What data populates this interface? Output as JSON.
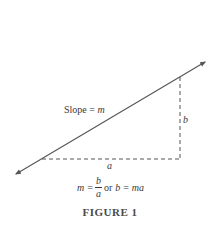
{
  "figure": {
    "caption": "FIGURE 1",
    "slope_label_prefix": "Slope = ",
    "slope_label_var": "m",
    "vertical_leg_label": "b",
    "horizontal_leg_label": "a",
    "formula": {
      "lhs": "m",
      "eq1": "=",
      "frac_num": "b",
      "frac_den": "a",
      "connector": "or",
      "lhs2": "b",
      "eq2": "=",
      "rhs2": "ma"
    },
    "colors": {
      "line": "#555555",
      "dashed": "#555555",
      "text": "#3a3a3a",
      "background": "#ffffff"
    }
  }
}
